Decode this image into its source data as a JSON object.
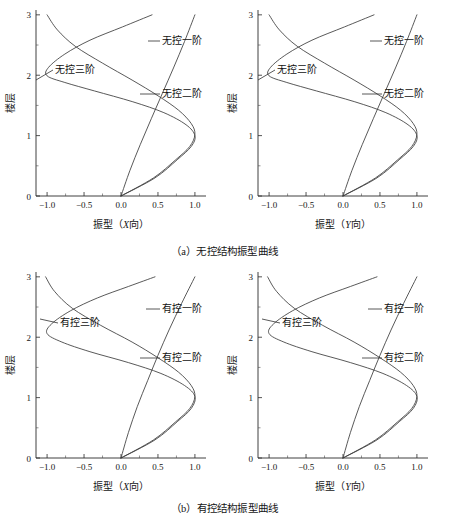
{
  "figure": {
    "captions": {
      "a": "（a）无控结构振型曲线",
      "b": "（b）有控结构振型曲线"
    }
  },
  "chart_data": [
    {
      "id": "panel-a-x",
      "type": "line",
      "title": "",
      "xlabel_prefix": "振型（",
      "xlabel_axis": "X",
      "xlabel_suffix": "向）",
      "ylabel": "楼层",
      "xlim": [
        -1.15,
        1.15
      ],
      "ylim": [
        0,
        3.08
      ],
      "xticks": [
        "-1.0",
        "-0.5",
        "0.0",
        "0.5",
        "1.0"
      ],
      "xtick_values": [
        -1.0,
        -0.5,
        0.0,
        0.5,
        1.0
      ],
      "yticks": [
        "0",
        "1",
        "2",
        "3"
      ],
      "ytick_values": [
        0,
        1,
        2,
        3
      ],
      "grid": false,
      "legend": "annotations",
      "series": [
        {
          "name": "无控一阶",
          "label": "无控一阶",
          "x": [
            0.0,
            0.12,
            0.26,
            0.41,
            0.56,
            0.71,
            0.86,
            1.0
          ],
          "y": [
            0.0,
            0.42,
            0.85,
            1.28,
            1.7,
            2.12,
            2.56,
            3.0
          ]
        },
        {
          "name": "无控二阶",
          "label": "无控二阶",
          "x": [
            0.0,
            0.44,
            0.74,
            0.93,
            1.0,
            0.95,
            0.78,
            0.5,
            0.15,
            -0.25,
            -0.62,
            -0.86,
            -1.0
          ],
          "y": [
            0.0,
            0.3,
            0.6,
            0.82,
            1.02,
            1.2,
            1.42,
            1.66,
            1.92,
            2.2,
            2.48,
            2.75,
            3.0
          ]
        },
        {
          "name": "无控三阶",
          "label": "无控三阶",
          "x": [
            0.0,
            0.46,
            0.76,
            0.95,
            1.0,
            0.88,
            0.58,
            0.16,
            -0.36,
            -0.76,
            -1.0,
            -0.98,
            -0.76,
            -0.42,
            0.02,
            0.42
          ],
          "y": [
            0.0,
            0.3,
            0.6,
            0.82,
            1.0,
            1.18,
            1.38,
            1.56,
            1.74,
            1.88,
            1.99,
            2.13,
            2.35,
            2.58,
            2.8,
            3.0
          ]
        }
      ]
    },
    {
      "id": "panel-a-y",
      "type": "line",
      "title": "",
      "xlabel_prefix": "振型（",
      "xlabel_axis": "Y",
      "xlabel_suffix": "向）",
      "ylabel": "楼层",
      "xlim": [
        -1.15,
        1.15
      ],
      "ylim": [
        0,
        3.08
      ],
      "xticks": [
        "-1.0",
        "-0.5",
        "0.0",
        "0.5",
        "1.0"
      ],
      "xtick_values": [
        -1.0,
        -0.5,
        0.0,
        0.5,
        1.0
      ],
      "yticks": [
        "0",
        "1",
        "2",
        "3"
      ],
      "ytick_values": [
        0,
        1,
        2,
        3
      ],
      "grid": false,
      "legend": "annotations",
      "series": [
        {
          "name": "无控一阶",
          "label": "无控一阶",
          "x": [
            0.0,
            0.12,
            0.26,
            0.41,
            0.56,
            0.71,
            0.86,
            1.0
          ],
          "y": [
            0.0,
            0.42,
            0.85,
            1.28,
            1.7,
            2.12,
            2.56,
            3.0
          ]
        },
        {
          "name": "无控二阶",
          "label": "无控二阶",
          "x": [
            0.0,
            0.44,
            0.74,
            0.93,
            1.0,
            0.95,
            0.78,
            0.5,
            0.15,
            -0.25,
            -0.62,
            -0.86,
            -1.0
          ],
          "y": [
            0.0,
            0.3,
            0.6,
            0.82,
            1.02,
            1.2,
            1.42,
            1.66,
            1.92,
            2.2,
            2.48,
            2.75,
            3.0
          ]
        },
        {
          "name": "无控三阶",
          "label": "无控三阶",
          "x": [
            0.0,
            0.46,
            0.76,
            0.95,
            1.0,
            0.88,
            0.58,
            0.16,
            -0.36,
            -0.76,
            -1.0,
            -0.98,
            -0.76,
            -0.42,
            0.02,
            0.42
          ],
          "y": [
            0.0,
            0.3,
            0.6,
            0.82,
            1.0,
            1.18,
            1.38,
            1.56,
            1.74,
            1.88,
            1.99,
            2.13,
            2.35,
            2.58,
            2.8,
            3.0
          ]
        }
      ]
    },
    {
      "id": "panel-b-x",
      "type": "line",
      "title": "",
      "xlabel_prefix": "振型（",
      "xlabel_axis": "X",
      "xlabel_suffix": "向）",
      "ylabel": "楼层",
      "xlim": [
        -1.15,
        1.15
      ],
      "ylim": [
        0,
        3.08
      ],
      "xticks": [
        "-1.0",
        "-0.5",
        "0.0",
        "0.5",
        "1.0"
      ],
      "xtick_values": [
        -1.0,
        -0.5,
        0.0,
        0.5,
        1.0
      ],
      "yticks": [
        "0",
        "1",
        "2",
        "3"
      ],
      "ytick_values": [
        0,
        1,
        2,
        3
      ],
      "grid": false,
      "legend": "annotations",
      "series": [
        {
          "name": "有控一阶",
          "label": "有控一阶",
          "x": [
            0.0,
            0.1,
            0.22,
            0.36,
            0.5,
            0.65,
            0.82,
            1.0
          ],
          "y": [
            0.0,
            0.42,
            0.85,
            1.28,
            1.7,
            2.12,
            2.56,
            3.0
          ]
        },
        {
          "name": "有控二阶",
          "label": "有控二阶",
          "x": [
            0.0,
            0.44,
            0.74,
            0.93,
            1.0,
            0.95,
            0.78,
            0.5,
            0.15,
            -0.28,
            -0.66,
            -0.9,
            -1.02
          ],
          "y": [
            0.0,
            0.3,
            0.6,
            0.82,
            1.02,
            1.2,
            1.42,
            1.66,
            1.92,
            2.2,
            2.48,
            2.76,
            3.0
          ]
        },
        {
          "name": "有控三阶",
          "label": "有控三阶",
          "x": [
            0.0,
            0.46,
            0.76,
            0.95,
            1.0,
            0.86,
            0.54,
            0.1,
            -0.42,
            -0.8,
            -1.0,
            -0.94,
            -0.68,
            -0.32,
            0.1,
            0.46
          ],
          "y": [
            0.0,
            0.3,
            0.6,
            0.82,
            1.02,
            1.2,
            1.4,
            1.58,
            1.76,
            1.92,
            2.06,
            2.22,
            2.44,
            2.65,
            2.84,
            3.0
          ]
        }
      ]
    },
    {
      "id": "panel-b-y",
      "type": "line",
      "title": "",
      "xlabel_prefix": "振型（",
      "xlabel_axis": "Y",
      "xlabel_suffix": "向）",
      "ylabel": "楼层",
      "xlim": [
        -1.15,
        1.15
      ],
      "ylim": [
        0,
        3.08
      ],
      "xticks": [
        "-1.0",
        "-0.5",
        "0.0",
        "0.5",
        "1.0"
      ],
      "xtick_values": [
        -1.0,
        -0.5,
        0.0,
        0.5,
        1.0
      ],
      "yticks": [
        "0",
        "1",
        "2",
        "3"
      ],
      "ytick_values": [
        0,
        1,
        2,
        3
      ],
      "grid": false,
      "legend": "annotations",
      "series": [
        {
          "name": "有控一阶",
          "label": "有控一阶",
          "x": [
            0.0,
            0.1,
            0.22,
            0.36,
            0.5,
            0.65,
            0.82,
            1.0
          ],
          "y": [
            0.0,
            0.42,
            0.85,
            1.28,
            1.7,
            2.12,
            2.56,
            3.0
          ]
        },
        {
          "name": "有控二阶",
          "label": "有控二阶",
          "x": [
            0.0,
            0.44,
            0.74,
            0.93,
            1.0,
            0.95,
            0.78,
            0.5,
            0.15,
            -0.28,
            -0.66,
            -0.9,
            -1.02
          ],
          "y": [
            0.0,
            0.3,
            0.6,
            0.82,
            1.02,
            1.2,
            1.42,
            1.66,
            1.92,
            2.2,
            2.48,
            2.76,
            3.0
          ]
        },
        {
          "name": "有控三阶",
          "label": "有控三阶",
          "x": [
            0.0,
            0.46,
            0.76,
            0.95,
            1.0,
            0.86,
            0.54,
            0.1,
            -0.42,
            -0.8,
            -1.0,
            -0.94,
            -0.68,
            -0.32,
            0.1,
            0.46
          ],
          "y": [
            0.0,
            0.3,
            0.6,
            0.82,
            1.02,
            1.2,
            1.4,
            1.58,
            1.76,
            1.92,
            2.06,
            2.22,
            2.44,
            2.65,
            2.84,
            3.0
          ]
        }
      ]
    }
  ],
  "annotations": {
    "panel-a-x": [
      {
        "label": "无控一阶",
        "text_x": 162,
        "text_y": 44,
        "leader_x1": 148,
        "leader_y1": 41,
        "leader_x2": 160,
        "leader_y2": 41,
        "anchor": "start"
      },
      {
        "label": "无控二阶",
        "text_x": 162,
        "text_y": 97,
        "leader_x1": 140,
        "leader_y1": 94,
        "leader_x2": 160,
        "leader_y2": 94,
        "anchor": "start"
      },
      {
        "label": "无控三阶",
        "text_x": 55,
        "text_y": 73,
        "leader_x1": 36,
        "leader_y1": 80,
        "leader_x2": 53,
        "leader_y2": 70,
        "anchor": "start"
      }
    ],
    "panel-a-y": [
      {
        "label": "无控一阶",
        "text_x": 162,
        "text_y": 44,
        "leader_x1": 148,
        "leader_y1": 41,
        "leader_x2": 160,
        "leader_y2": 41,
        "anchor": "start"
      },
      {
        "label": "无控二阶",
        "text_x": 162,
        "text_y": 97,
        "leader_x1": 140,
        "leader_y1": 94,
        "leader_x2": 160,
        "leader_y2": 94,
        "anchor": "start"
      },
      {
        "label": "无控三阶",
        "text_x": 55,
        "text_y": 73,
        "leader_x1": 36,
        "leader_y1": 80,
        "leader_x2": 53,
        "leader_y2": 70,
        "anchor": "start"
      }
    ],
    "panel-b-x": [
      {
        "label": "有控一阶",
        "text_x": 162,
        "text_y": 50,
        "leader_x1": 146,
        "leader_y1": 47,
        "leader_x2": 160,
        "leader_y2": 47,
        "anchor": "start"
      },
      {
        "label": "有控二阶",
        "text_x": 162,
        "text_y": 99,
        "leader_x1": 140,
        "leader_y1": 96,
        "leader_x2": 160,
        "leader_y2": 96,
        "anchor": "start"
      },
      {
        "label": "有控三阶",
        "text_x": 60,
        "text_y": 64,
        "leader_x1": 40,
        "leader_y1": 57,
        "leader_x2": 58,
        "leader_y2": 61,
        "anchor": "start"
      }
    ],
    "panel-b-y": [
      {
        "label": "有控一阶",
        "text_x": 162,
        "text_y": 50,
        "leader_x1": 146,
        "leader_y1": 47,
        "leader_x2": 160,
        "leader_y2": 47,
        "anchor": "start"
      },
      {
        "label": "有控二阶",
        "text_x": 162,
        "text_y": 99,
        "leader_x1": 140,
        "leader_y1": 96,
        "leader_x2": 160,
        "leader_y2": 96,
        "anchor": "start"
      },
      {
        "label": "有控三阶",
        "text_x": 60,
        "text_y": 64,
        "leader_x1": 40,
        "leader_y1": 57,
        "leader_x2": 58,
        "leader_y2": 61,
        "anchor": "start"
      }
    ]
  }
}
